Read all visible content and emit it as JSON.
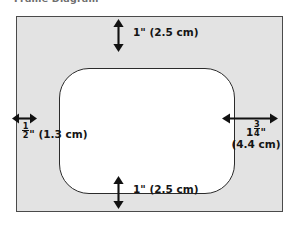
{
  "title": "Frame Diagram",
  "diagram": {
    "type": "frame-matting-dimension-diagram",
    "frame": {
      "name": "picture-frame-mat",
      "fill_color": "#e3e3e3",
      "border_color": "#4a4a4a"
    },
    "opening": {
      "name": "frame-opening",
      "fill_color": "#ffffff",
      "border_color": "#2b2b2b",
      "shape": "rounded-rectangle"
    },
    "dimensions": [
      {
        "id": "top-margin",
        "position": "top",
        "arrow": "vertical-double",
        "inches": "1\"",
        "metric": "(2.5 cm)",
        "label": "1\" (2.5 cm)"
      },
      {
        "id": "bottom-margin",
        "position": "bottom",
        "arrow": "vertical-double",
        "inches": "1\"",
        "metric": "(2.5 cm)",
        "label": "1\" (2.5 cm)"
      },
      {
        "id": "left-margin",
        "position": "left",
        "arrow": "horizontal-double",
        "whole": "",
        "fraction_numerator": "1",
        "fraction_denominator": "2",
        "inch_mark": "\"",
        "metric": "(1.3 cm)",
        "label": "1/2\" (1.3 cm)"
      },
      {
        "id": "right-margin",
        "position": "right",
        "arrow": "horizontal-double",
        "whole": "1",
        "fraction_numerator": "3",
        "fraction_denominator": "4",
        "inch_mark": "\"",
        "metric": "(4.4 cm)",
        "label": "1 3/4\" (4.4 cm)"
      }
    ]
  }
}
